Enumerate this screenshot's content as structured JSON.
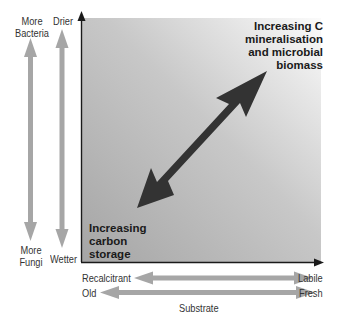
{
  "diagram": {
    "left_axis_1": {
      "top_label": "More\nBacteria",
      "top_lines": [
        "More",
        "Bacteria"
      ],
      "bottom_lines": [
        "More",
        "Fungi"
      ]
    },
    "left_axis_2": {
      "top_label": "Drier",
      "bottom_label": "Wetter"
    },
    "top_right_annotation": [
      "Increasing C",
      "mineralisation",
      "and microbial",
      "biomass"
    ],
    "bottom_left_annotation": [
      "Increasing",
      "carbon",
      "storage"
    ],
    "bottom_axis_1": {
      "left_label": "Recalcitrant",
      "right_label": "Labile"
    },
    "bottom_axis_2": {
      "left_label": "Old",
      "right_label": "Fresh"
    },
    "x_title": "Substrate",
    "colors": {
      "panel_gradient_start": "#a9a9a9",
      "panel_gradient_end": "#fafafa",
      "main_arrow": "#333333",
      "side_arrows": "#a6a6a6",
      "axis": "#1a1a1a"
    }
  }
}
